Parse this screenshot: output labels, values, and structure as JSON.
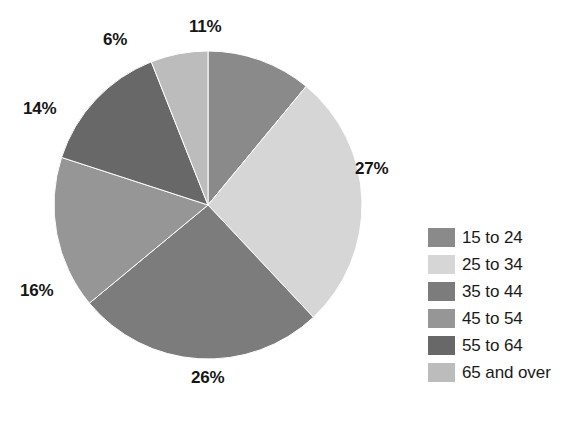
{
  "chart_data": {
    "type": "pie",
    "title": "",
    "subtitle": "",
    "xlabel": "",
    "ylabel": "",
    "grid": false,
    "legend_position": "right",
    "units": "percent",
    "start_angle_deg": 0,
    "direction": "clockwise",
    "categories": [
      "15 to 24",
      "25 to 34",
      "35 to 44",
      "45 to 54",
      "55 to 64",
      "65 and over"
    ],
    "values": [
      11,
      27,
      26,
      16,
      14,
      6
    ],
    "data_labels": [
      "11%",
      "27%",
      "26%",
      "16%",
      "14%",
      "6%"
    ],
    "colors": [
      "#8a8a8a",
      "#d6d6d6",
      "#7c7c7c",
      "#969696",
      "#686868",
      "#bcbcbc"
    ],
    "slices": [
      {
        "label": "15 to 24",
        "value": 11,
        "display": "11%",
        "color": "#8a8a8a"
      },
      {
        "label": "25 to 34",
        "value": 27,
        "display": "27%",
        "color": "#d6d6d6"
      },
      {
        "label": "35 to 44",
        "value": 26,
        "display": "26%",
        "color": "#7c7c7c"
      },
      {
        "label": "45 to 54",
        "value": 16,
        "display": "16%",
        "color": "#969696"
      },
      {
        "label": "55 to 64",
        "value": 14,
        "display": "14%",
        "color": "#686868"
      },
      {
        "label": "65 and over",
        "value": 6,
        "display": "6%",
        "color": "#bcbcbc"
      }
    ]
  },
  "labels": {
    "slice_1": "11%",
    "slice_2": "27%",
    "slice_3": "26%",
    "slice_4": "16%",
    "slice_5": "14%",
    "slice_6": "6%"
  },
  "legend": {
    "items": [
      {
        "label": "15 to 24",
        "color": "#8a8a8a"
      },
      {
        "label": "25 to 34",
        "color": "#d6d6d6"
      },
      {
        "label": "35 to 44",
        "color": "#7c7c7c"
      },
      {
        "label": "45 to 54",
        "color": "#969696"
      },
      {
        "label": "55 to 64",
        "color": "#686868"
      },
      {
        "label": "65 and over",
        "color": "#bcbcbc"
      }
    ]
  }
}
